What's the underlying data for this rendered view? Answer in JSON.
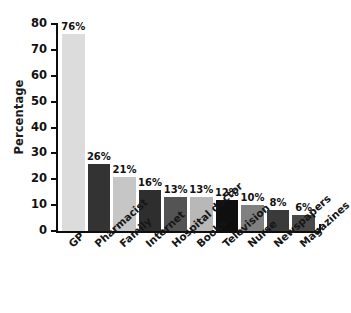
{
  "chart_data": {
    "type": "bar",
    "title": "",
    "subtitle": "",
    "xlabel": "",
    "ylabel": "Percentage",
    "ylim": [
      0,
      80
    ],
    "ytick_step": 10,
    "yticks": [
      "80",
      "70",
      "60",
      "50",
      "40",
      "30",
      "20",
      "10",
      "0"
    ],
    "grid": false,
    "legend": false,
    "categories": [
      "GP",
      "Pharmacist",
      "Family",
      "Internet",
      "Hospital doctor",
      "Books",
      "Television",
      "Nurse",
      "Newspapers",
      "Magazines"
    ],
    "values": [
      76,
      26,
      21,
      16,
      13,
      13,
      12,
      10,
      8,
      6
    ],
    "data_labels": [
      "76%",
      "26%",
      "21%",
      "16%",
      "13%",
      "13%",
      "12%",
      "10%",
      "8%",
      "6%"
    ],
    "bar_colors": [
      "#dcdcdc",
      "#333333",
      "#c6c6c6",
      "#2e2e2e",
      "#545454",
      "#b8b8b8",
      "#0f0f0f",
      "#808080",
      "#3a3a3a",
      "#494949"
    ],
    "axis_color": "#0d0d0d",
    "label_color": "#111111",
    "background_color": "#ffffff"
  }
}
